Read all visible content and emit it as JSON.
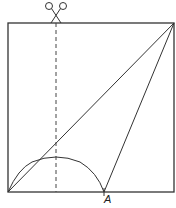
{
  "diagram": {
    "point_labels": [
      {
        "id": "A",
        "text": "A"
      }
    ],
    "colors": {
      "stroke": "#333333",
      "background": "#ffffff"
    }
  }
}
